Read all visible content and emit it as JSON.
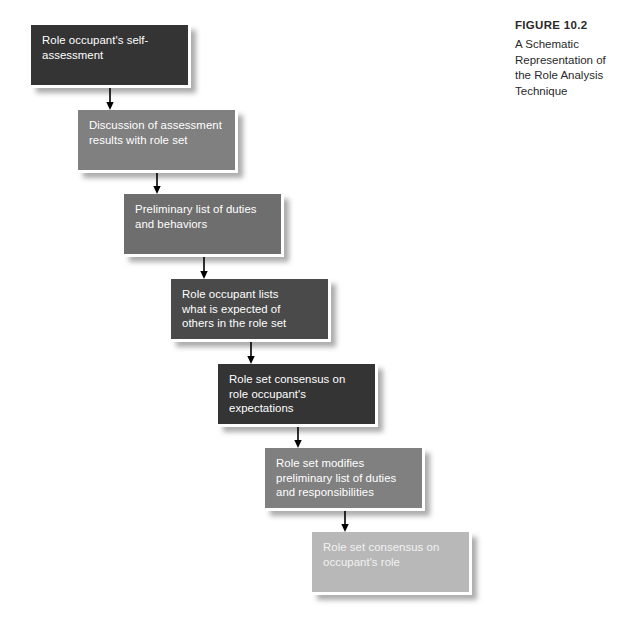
{
  "figure": {
    "number_label": "FIGURE 10.2",
    "caption": "A Schematic Representation of the Role Analysis Technique",
    "background_color": "#ffffff"
  },
  "palette": {
    "dark": "#343434",
    "mid": "#808080",
    "mid_dark": "#6e6e6e",
    "light": "#b8b8b8",
    "arrow": "#000000",
    "box_border": "#ffffff",
    "caption_text": "#2a2a2a"
  },
  "diagram": {
    "type": "flowchart",
    "orientation": "top-to-bottom staircase",
    "step_count": 7,
    "steps": [
      {
        "index": 1,
        "text": "Role occupant's self-\nassessment",
        "tone": "dark",
        "color": "#343434",
        "x": 31,
        "y": 25
      },
      {
        "index": 2,
        "text": "Discussion of assessment\nresults with role set",
        "tone": "mid",
        "color": "#808080",
        "x": 78,
        "y": 110
      },
      {
        "index": 3,
        "text": "Preliminary list of duties\nand behaviors",
        "tone": "mid-dark",
        "color": "#6e6e6e",
        "x": 124,
        "y": 194
      },
      {
        "index": 4,
        "text": "Role occupant lists\nwhat is expected of\nothers in the role set",
        "tone": "dark",
        "color": "#4a4a4a",
        "x": 171,
        "y": 279
      },
      {
        "index": 5,
        "text": "Role set consensus on\nrole occupant's\nexpectations",
        "tone": "dark",
        "color": "#343434",
        "x": 218,
        "y": 364
      },
      {
        "index": 6,
        "text": "Role set modifies\npreliminary list of duties\nand responsibilities",
        "tone": "mid",
        "color": "#808080",
        "x": 265,
        "y": 448
      },
      {
        "index": 7,
        "text": "Role set consensus on\noccupant's role",
        "tone": "light",
        "color": "#b8b8b8",
        "x": 312,
        "y": 532
      }
    ],
    "connectors": [
      {
        "index": 1,
        "from_step": 1,
        "to_step": 2,
        "x": 110,
        "y": 88,
        "length": 22
      },
      {
        "index": 2,
        "from_step": 2,
        "to_step": 3,
        "x": 157,
        "y": 173,
        "length": 21
      },
      {
        "index": 3,
        "from_step": 3,
        "to_step": 4,
        "x": 204,
        "y": 257,
        "length": 22
      },
      {
        "index": 4,
        "from_step": 4,
        "to_step": 5,
        "x": 251,
        "y": 342,
        "length": 22
      },
      {
        "index": 5,
        "from_step": 5,
        "to_step": 6,
        "x": 298,
        "y": 427,
        "length": 21
      },
      {
        "index": 6,
        "from_step": 6,
        "to_step": 7,
        "x": 345,
        "y": 511,
        "length": 21
      }
    ]
  }
}
